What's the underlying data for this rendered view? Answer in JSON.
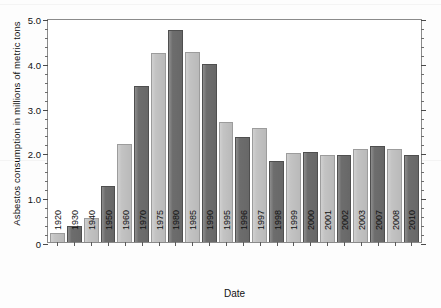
{
  "chart_data": {
    "type": "bar",
    "title": "",
    "xlabel": "Date",
    "ylabel": "Asbestos consumption in millions of metric tons",
    "ylim": [
      0,
      5.0
    ],
    "ytick_labels": [
      "0",
      "1.0",
      "2.0",
      "3.0",
      "4.0",
      "5.0"
    ],
    "ytick_values": [
      0,
      1.0,
      2.0,
      3.0,
      4.0,
      5.0
    ],
    "minor_tick_step": 0.2,
    "grid": false,
    "legend": null,
    "categories": [
      "1920",
      "1930",
      "1940",
      "1950",
      "1960",
      "1970",
      "1975",
      "1980",
      "1985",
      "1990",
      "1995",
      "1996",
      "1997",
      "1998",
      "1999",
      "2000",
      "2001",
      "2002",
      "2003",
      "2007",
      "2008",
      "2010"
    ],
    "values": [
      0.2,
      0.37,
      0.55,
      1.27,
      2.2,
      3.52,
      4.25,
      4.78,
      4.28,
      4.0,
      2.7,
      2.37,
      2.57,
      1.83,
      2.0,
      2.03,
      1.95,
      1.95,
      2.1,
      2.17,
      2.1,
      1.97
    ],
    "bar_colors": [
      "light",
      "dark",
      "light",
      "dark",
      "light",
      "dark",
      "light",
      "dark",
      "light",
      "dark",
      "light",
      "dark",
      "light",
      "dark",
      "light",
      "dark",
      "light",
      "dark",
      "light",
      "dark",
      "light",
      "dark"
    ],
    "colors": {
      "dark_bar": "#6d6d6d",
      "light_bar": "#c3c3c3",
      "axis": "#8a8a8a",
      "text": "#111111",
      "background": "#ffffff"
    }
  }
}
